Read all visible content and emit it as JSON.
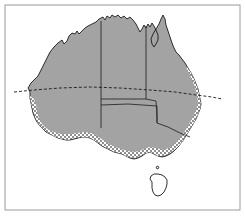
{
  "figure": {
    "name": "australia-distribution-map",
    "frame": {
      "visible": true,
      "color": "#9a9a9a",
      "x": 5,
      "y": 5,
      "width": 235,
      "height": 205
    }
  },
  "colors": {
    "background": "#ffffff",
    "land_fill": "#a3a3a3",
    "coast_outline": "#1a1a1a",
    "state_border": "#2b2b2b",
    "stipple_dark": "#8f8f8f",
    "stipple_light": "#ffffff",
    "dashed_line": "#1a1a1a",
    "frame": "#9a9a9a"
  },
  "map_layers": {
    "mainland": {
      "label": "australian-mainland",
      "fill": "solid-grey",
      "outline_width": 0.9
    },
    "stipple_band": {
      "label": "stippled-coastal-band",
      "fill": "checkerboard",
      "cell_size": 2,
      "regions": [
        "south-west-coast",
        "great-australian-bight",
        "south-east-coast",
        "east-coast"
      ]
    },
    "tasmania": {
      "label": "tasmania",
      "fill": "none",
      "outline_only": true
    },
    "dashed_latitude": {
      "label": "tropic-of-capricorn",
      "style": "dashed",
      "dash_pattern": "3 2",
      "width": 0.9,
      "extends_offshore": true
    },
    "state_borders": {
      "label": "state-boundaries",
      "lines": [
        "wa-nt-sa-vertical",
        "nt-qld-vertical",
        "nt-sa-horizontal",
        "sa-qld-nsw-horizontal",
        "sa-nsw-vic-vertical",
        "nsw-vic-diagonal"
      ]
    }
  },
  "paths": {
    "mainland_outline": "M 30 92 L 28 88 L 31 83 L 34 80 L 38 76 L 41 70 L 44 64 L 47 58 L 50 52 L 54 47 L 58 43 L 62 40 L 64 44 L 67 41 L 69 36 L 72 33 L 75 34 L 77 31 L 79 34 L 82 31 L 85 28 L 88 26 L 92 24 L 96 22 L 99 19 L 103 17 L 105 20 L 107 16 L 110 18 L 112 15 L 115 17 L 118 15 L 121 18 L 124 16 L 127 19 L 130 17 L 133 20 L 136 24 L 138 28 L 140 32 L 142 29 L 144 25 L 146 28 L 148 24 L 150 27 L 152 23 L 154 26 L 156 30 L 158 35 L 158 40 L 156 44 L 154 47 L 152 44 L 151 39 L 153 34 L 156 29 L 159 24 L 161 19 L 163 15 L 165 19 L 166 25 L 168 31 L 170 37 L 172 43 L 174 48 L 176 52 L 179 55 L 182 59 L 185 63 L 188 68 L 191 73 L 194 79 L 196 84 L 198 89 L 199 94 L 200 99 L 201 104 L 200 109 L 198 114 L 196 119 L 193 124 L 190 129 L 187 134 L 184 139 L 181 143 L 178 147 L 174 151 L 170 154 L 166 156 L 162 157 L 158 156 L 154 154 L 150 152 L 146 153 L 142 156 L 138 158 L 134 159 L 130 158 L 126 156 L 122 154 L 118 153 L 114 152 L 110 150 L 106 148 L 102 146 L 98 143 L 94 140 L 90 138 L 86 137 L 82 137 L 78 138 L 74 139 L 70 140 L 66 140 L 62 139 L 58 138 L 54 136 L 50 134 L 46 132 L 43 129 L 40 126 L 37 122 L 35 118 L 33 113 L 32 108 L 31 103 L 30 98 Z",
    "tasmania_outline": "M 152 182 L 150 179 L 151 176 L 154 174 L 158 174 L 162 175 L 165 177 L 167 180 L 167 184 L 166 188 L 164 192 L 161 195 L 158 196 L 155 195 L 153 192 L 152 188 Z"
  },
  "annotations": {
    "visible_text": [],
    "legend": null,
    "title": null,
    "axis_labels": []
  }
}
